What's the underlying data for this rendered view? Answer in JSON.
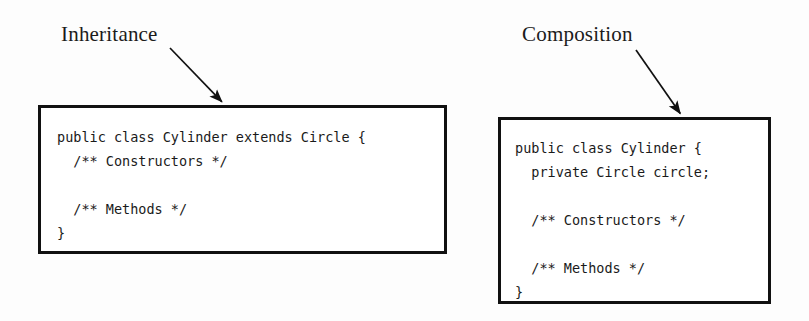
{
  "figure": {
    "background_color": "#fdfdfd",
    "ink_color": "#111111"
  },
  "annotations": [
    {
      "id": "inheritance",
      "label": "Inheritance",
      "arrow": {
        "name": "inheritance-arrow",
        "from_x": 170,
        "from_y": 48,
        "to_x": 224,
        "to_y": 104
      }
    },
    {
      "id": "composition",
      "label": "Composition",
      "arrow": {
        "name": "composition-arrow",
        "from_x": 636,
        "from_y": 50,
        "to_x": 682,
        "to_y": 116
      }
    }
  ],
  "code_boxes": {
    "inheritance": {
      "name": "inheritance-code-box",
      "border_color": "#111111",
      "lines": [
        "public class Cylinder extends Circle {",
        "  /** Constructors */",
        "",
        "  /** Methods */",
        "}"
      ],
      "code": "public class Cylinder extends Circle {\n  /** Constructors */\n\n  /** Methods */\n}"
    },
    "composition": {
      "name": "composition-code-box",
      "border_color": "#111111",
      "lines": [
        "public class Cylinder {",
        "  private Circle circle;",
        "",
        "  /** Constructors */",
        "",
        "  /** Methods */",
        "}"
      ],
      "code": "public class Cylinder {\n  private Circle circle;\n\n  /** Constructors */\n\n  /** Methods */\n}"
    }
  }
}
